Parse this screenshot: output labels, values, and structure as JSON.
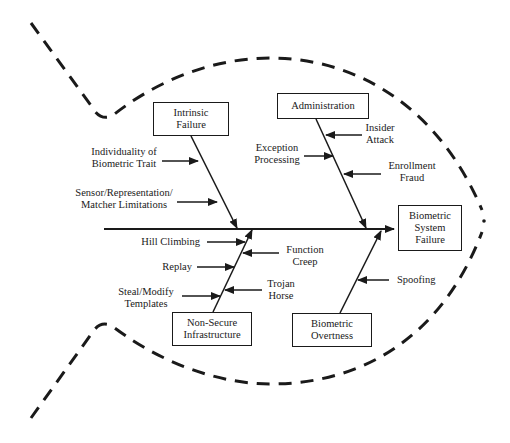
{
  "diagram": {
    "type": "fishbone",
    "effect": {
      "label": "Biometric\nSystem\nFailure"
    },
    "categories": [
      {
        "label": "Intrinsic\nFailure",
        "position": "top-left",
        "causes": [
          "Individuality of\nBiometric Trait",
          "Sensor/Representation/\nMatcher Limitations"
        ]
      },
      {
        "label": "Administration",
        "position": "top-right",
        "causes": [
          "Insider\nAttack",
          "Exception\nProcessing",
          "Enrollment\nFraud"
        ]
      },
      {
        "label": "Non-Secure\nInfrastructure",
        "position": "bottom-left",
        "causes": [
          "Hill Climbing",
          "Function\nCreep",
          "Replay",
          "Trojan\nHorse",
          "Steal/Modify\nTemplates"
        ]
      },
      {
        "label": "Biometric\nOvertness",
        "position": "bottom-right",
        "causes": [
          "Spoofing"
        ]
      }
    ],
    "colors": {
      "line": "#1a1a1a",
      "background": "#ffffff"
    }
  }
}
